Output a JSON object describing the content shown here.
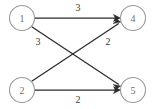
{
  "diagram": {
    "type": "directed-bipartite-graph",
    "title": "",
    "colors": {
      "background": "#ffffff",
      "node_stroke": "#9a9a9a",
      "node_fill": "#ffffff",
      "node_label": "#6f6f6f",
      "edge": "#2b2b2b",
      "edge_label": "#3a3a3a"
    },
    "nodes": [
      {
        "id": "1",
        "label": "1",
        "cx": 22,
        "cy": 18,
        "r": 12.5,
        "side": "left"
      },
      {
        "id": "2",
        "label": "2",
        "cx": 22,
        "cy": 90,
        "r": 12.5,
        "side": "left"
      },
      {
        "id": "4",
        "label": "4",
        "cx": 133,
        "cy": 18,
        "r": 12.5,
        "side": "right"
      },
      {
        "id": "5",
        "label": "5",
        "cx": 133,
        "cy": 90,
        "r": 12.5,
        "side": "right"
      }
    ],
    "edges": [
      {
        "from": "1",
        "to": "4",
        "weight": "3",
        "label_x": 78,
        "label_y": 7
      },
      {
        "from": "1",
        "to": "5",
        "weight": "3",
        "label_x": 38,
        "label_y": 41
      },
      {
        "from": "2",
        "to": "4",
        "weight": "2",
        "label_x": 108,
        "label_y": 41
      },
      {
        "from": "2",
        "to": "5",
        "weight": "2",
        "label_x": 78,
        "label_y": 99
      }
    ]
  }
}
